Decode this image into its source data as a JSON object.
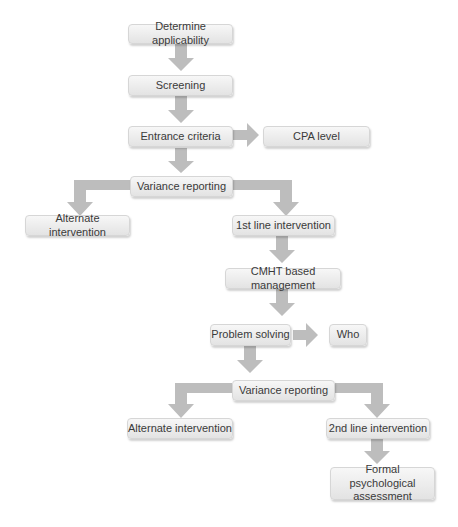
{
  "diagram": {
    "type": "flowchart",
    "colors": {
      "box_fill": "#ebebeb",
      "box_border": "#d6d6d6",
      "arrow": "#b8b8b8",
      "text": "#3a3a3a"
    },
    "nodes": {
      "determine": "Determine applicability",
      "screening": "Screening",
      "entrance": "Entrance criteria",
      "cpa": "CPA level",
      "variance1": "Variance reporting",
      "alternate1": "Alternate intervention",
      "first_line": "1st line intervention",
      "cmht": "CMHT based management",
      "problem": "Problem solving",
      "who": "Who",
      "variance2": "Variance reporting",
      "alternate2": "Alternate intervention",
      "second_line": "2nd line intervention",
      "formal": "Formal psychological assessment"
    },
    "edges": [
      [
        "determine",
        "screening"
      ],
      [
        "screening",
        "entrance"
      ],
      [
        "entrance",
        "cpa"
      ],
      [
        "entrance",
        "variance1"
      ],
      [
        "variance1",
        "alternate1"
      ],
      [
        "variance1",
        "first_line"
      ],
      [
        "first_line",
        "cmht"
      ],
      [
        "cmht",
        "problem"
      ],
      [
        "problem",
        "who"
      ],
      [
        "problem",
        "variance2"
      ],
      [
        "variance2",
        "alternate2"
      ],
      [
        "variance2",
        "second_line"
      ],
      [
        "second_line",
        "formal"
      ]
    ]
  }
}
